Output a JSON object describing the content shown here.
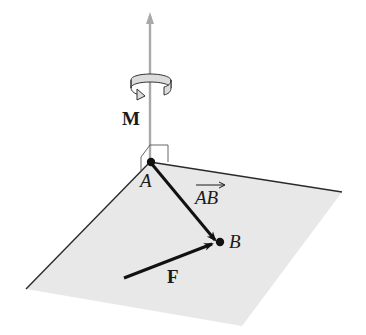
{
  "diagram": {
    "labels": {
      "moment": "M",
      "point_a": "A",
      "point_b": "B",
      "vector_ab": "AB",
      "force": "F"
    },
    "colors": {
      "plane_fill": "#e8e8e8",
      "plane_edge": "#2a2a2a",
      "moment_axis": "#a9a9a9",
      "vectors": "#111111",
      "rotation_arrow_fill": "#dcdcdc"
    }
  }
}
